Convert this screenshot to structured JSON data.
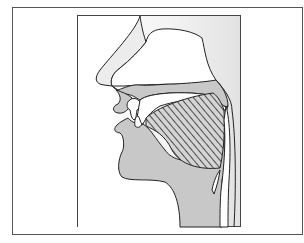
{
  "figure": {
    "title": "",
    "colors": {
      "background": "#ffffff",
      "outer_frame": "#555555",
      "inner_frame": "#444444",
      "backdrop_gray": "#e6e6e6",
      "tissue_gray": "#c8c8c8",
      "cavity_white": "#ffffff",
      "outline": "#222222",
      "hatch": "#333333"
    },
    "regions": [
      {
        "name": "nose",
        "fill": "light-gray"
      },
      {
        "name": "nasal-cavity",
        "fill": "white"
      },
      {
        "name": "hard-palate",
        "fill": "gray"
      },
      {
        "name": "velum",
        "fill": "gray"
      },
      {
        "name": "upper-lip",
        "fill": "gray"
      },
      {
        "name": "teeth",
        "fill": "white"
      },
      {
        "name": "lower-lip",
        "fill": "gray"
      },
      {
        "name": "tongue-back",
        "fill": "hatched"
      },
      {
        "name": "jaw-and-neck",
        "fill": "gray"
      },
      {
        "name": "pharynx",
        "fill": "white"
      },
      {
        "name": "epiglottis",
        "fill": "gray"
      }
    ]
  }
}
